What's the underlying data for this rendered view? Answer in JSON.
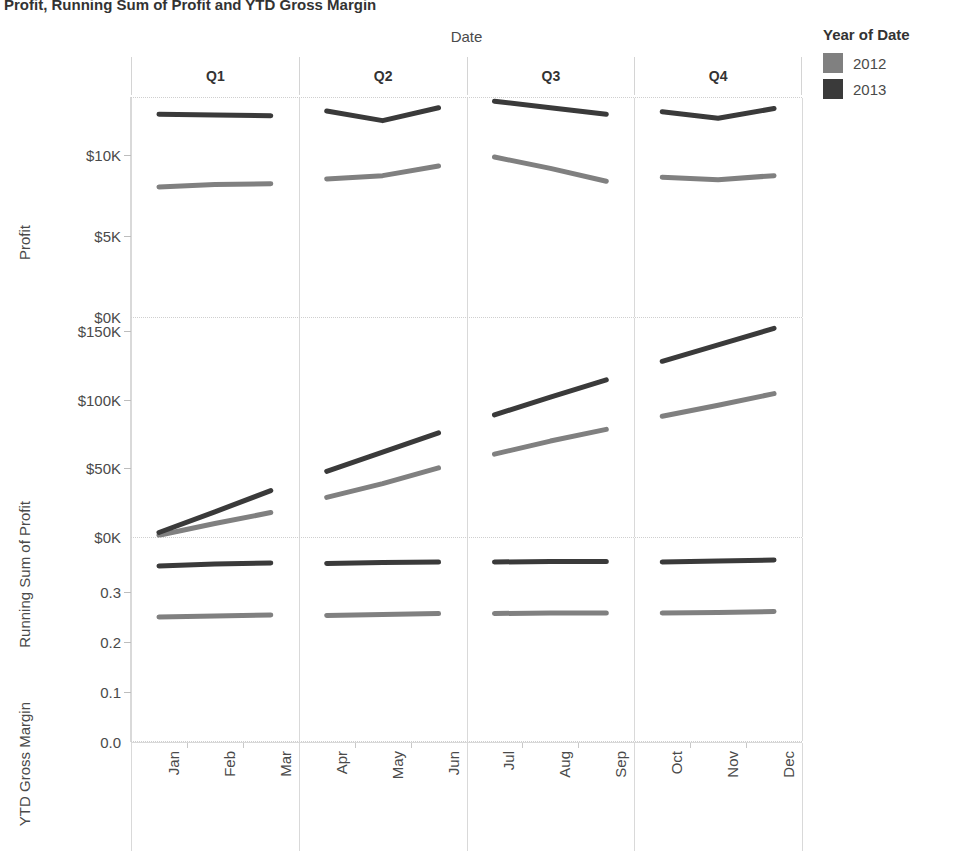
{
  "title": "Profit, Running Sum of Profit and YTD Gross Margin",
  "legend": {
    "title": "Year of Date",
    "entries": [
      {
        "label": "2012",
        "color": "#808080"
      },
      {
        "label": "2013",
        "color": "#3a3a3a"
      }
    ]
  },
  "column_axis": {
    "title": "Date",
    "quarters": [
      "Q1",
      "Q2",
      "Q3",
      "Q4"
    ],
    "months": [
      "Jan",
      "Feb",
      "Mar",
      "Apr",
      "May",
      "Jun",
      "Jul",
      "Aug",
      "Sep",
      "Oct",
      "Nov",
      "Dec"
    ]
  },
  "panels": [
    {
      "axis_title": "Profit",
      "ticks": [
        "$0K",
        "$5K",
        "$10K"
      ]
    },
    {
      "axis_title": "Running Sum of Profit",
      "ticks": [
        "$0K",
        "$50K",
        "$100K",
        "$150K"
      ]
    },
    {
      "axis_title": "YTD Gross Margin",
      "ticks": [
        "0.0",
        "0.1",
        "0.2",
        "0.3"
      ]
    }
  ],
  "chart_data": {
    "type": "line",
    "title": "Profit, Running Sum of Profit and YTD Gross Margin",
    "xlabel": "Date",
    "legend_title": "Year of Date",
    "legend_position": "right",
    "grid": true,
    "x": [
      "Jan",
      "Feb",
      "Mar",
      "Apr",
      "May",
      "Jun",
      "Jul",
      "Aug",
      "Sep",
      "Oct",
      "Nov",
      "Dec"
    ],
    "quarters": [
      "Q1",
      "Q2",
      "Q3",
      "Q4"
    ],
    "panels": [
      {
        "ylabel": "Profit",
        "ylim": [
          0,
          13600
        ],
        "yticks": [
          0,
          5000,
          10000
        ],
        "ytick_labels": [
          "$0K",
          "$5K",
          "$10K"
        ],
        "series": [
          {
            "name": "2012",
            "color": "#808080",
            "values": [
              8100,
              8250,
              8300,
              8600,
              8800,
              9400,
              9950,
              9250,
              8450,
              8700,
              8550,
              8800
            ]
          },
          {
            "name": "2013",
            "color": "#3a3a3a",
            "values": [
              12600,
              12550,
              12500,
              12800,
              12200,
              13000,
              13400,
              13000,
              12600,
              12750,
              12350,
              12950
            ]
          }
        ]
      },
      {
        "ylabel": "Running Sum of Profit",
        "ylim": [
          0,
          160000
        ],
        "yticks": [
          0,
          50000,
          100000,
          150000
        ],
        "ytick_labels": [
          "$0K",
          "$50K",
          "$100K",
          "$150K"
        ],
        "series": [
          {
            "name": "2012",
            "color": "#808080",
            "values": [
              2000,
              10500,
              18500,
              29500,
              39500,
              51000,
              61000,
              70500,
              79000,
              88500,
              96500,
              105000
            ]
          },
          {
            "name": "2013",
            "color": "#3a3a3a",
            "values": [
              4000,
              19000,
              34500,
              48500,
              62500,
              76500,
              89500,
              102500,
              115000,
              128500,
              140500,
              152500
            ]
          }
        ]
      },
      {
        "ylabel": "YTD Gross Margin",
        "ylim": [
          0.0,
          0.41
        ],
        "yticks": [
          0.0,
          0.1,
          0.2,
          0.3
        ],
        "ytick_labels": [
          "0.0",
          "0.1",
          "0.2",
          "0.3"
        ],
        "series": [
          {
            "name": "2012",
            "color": "#808080",
            "values": [
              0.252,
              0.254,
              0.256,
              0.255,
              0.257,
              0.259,
              0.259,
              0.26,
              0.26,
              0.26,
              0.261,
              0.263
            ]
          },
          {
            "name": "2013",
            "color": "#3a3a3a",
            "values": [
              0.354,
              0.358,
              0.36,
              0.359,
              0.361,
              0.362,
              0.362,
              0.363,
              0.363,
              0.362,
              0.364,
              0.366
            ]
          }
        ]
      }
    ]
  }
}
